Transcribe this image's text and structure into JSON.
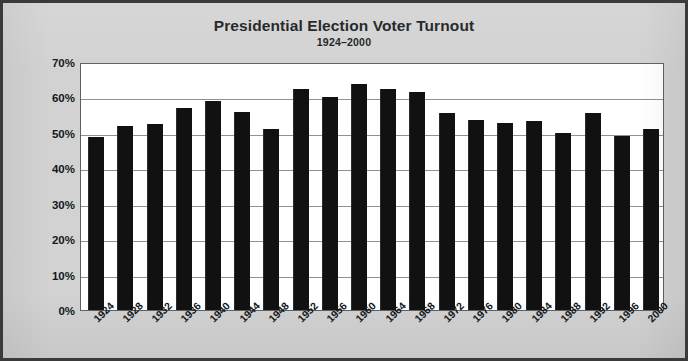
{
  "chart_data": {
    "type": "bar",
    "title": "Presidential Election Voter Turnout",
    "subtitle": "1924–2000",
    "xlabel": "",
    "ylabel": "Percent VAP* Voted",
    "ylim": [
      0,
      70
    ],
    "ytick_labels": [
      "0%",
      "10%",
      "20%",
      "30%",
      "40%",
      "50%",
      "60%",
      "70%"
    ],
    "ytick_values": [
      0,
      10,
      20,
      30,
      40,
      50,
      60,
      70
    ],
    "grid": true,
    "legend": false,
    "bar_color": "#111111",
    "plot_background": "#ffffff",
    "figure_background": "#d2d2d2",
    "categories": [
      "1924",
      "1928",
      "1932",
      "1936",
      "1940",
      "1944",
      "1948",
      "1952",
      "1956",
      "1960",
      "1964",
      "1968",
      "1972",
      "1976",
      "1980",
      "1984",
      "1988",
      "1992",
      "1996",
      "2000"
    ],
    "values": [
      48.9,
      51.9,
      52.5,
      56.9,
      58.9,
      56.0,
      51.1,
      62.5,
      60.2,
      63.8,
      62.5,
      61.4,
      55.5,
      53.6,
      52.8,
      53.3,
      50.1,
      55.6,
      49.0,
      51.0
    ]
  }
}
